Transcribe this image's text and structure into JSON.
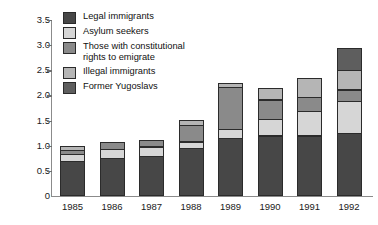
{
  "chart_data": {
    "type": "bar",
    "subtype": "stacked-vertical",
    "title": "",
    "subtitle": "",
    "xlabel": "",
    "ylabel": "Emigrants in millions",
    "categories": [
      "1985",
      "1986",
      "1987",
      "1988",
      "1989",
      "1990",
      "1991",
      "1992"
    ],
    "ylim": [
      0,
      3.5
    ],
    "ytick_labels": [
      "0",
      "0.5",
      "1.0",
      "1.5",
      "2.0",
      "2.5",
      "3.0",
      "3.5"
    ],
    "ytick_values": [
      0,
      0.5,
      1.0,
      1.5,
      2.0,
      2.5,
      3.0,
      3.5
    ],
    "grid": false,
    "legend_position": "inside-top-left",
    "units": "millions",
    "series": [
      {
        "name": "Legal immigrants",
        "color": "#474747",
        "values": [
          0.7,
          0.75,
          0.8,
          0.95,
          1.15,
          1.2,
          1.2,
          1.25
        ]
      },
      {
        "name": "Asylum seekers",
        "color": "#d6d6d6",
        "values": [
          0.15,
          0.2,
          0.2,
          0.15,
          0.2,
          0.35,
          0.5,
          0.65
        ]
      },
      {
        "name": "Those with constitutional\nrights to emigrate",
        "color": "#8a8a8a",
        "values": [
          0.1,
          0.15,
          0.15,
          0.35,
          0.85,
          0.4,
          0.3,
          0.25
        ]
      },
      {
        "name": "Illegal immigrants",
        "color": "#b5b5b5",
        "values": [
          0.1,
          0.0,
          0.0,
          0.1,
          0.1,
          0.25,
          0.4,
          0.4
        ]
      },
      {
        "name": "Former Yugoslavs",
        "color": "#5e5e5e",
        "values": [
          0.0,
          0.0,
          0.0,
          0.0,
          0.0,
          0.0,
          0.0,
          0.45
        ]
      }
    ],
    "totals": [
      1.05,
      1.1,
      1.15,
      1.55,
      2.3,
      2.2,
      2.4,
      3.0
    ]
  },
  "legend": {
    "items": [
      {
        "label": "Legal immigrants",
        "color": "#474747"
      },
      {
        "label": "Asylum seekers",
        "color": "#d6d6d6"
      },
      {
        "label": "Those with constitutional\nrights to emigrate",
        "color": "#8a8a8a"
      },
      {
        "label": "Illegal immigrants",
        "color": "#b5b5b5"
      },
      {
        "label": "Former Yugoslavs",
        "color": "#5e5e5e"
      }
    ]
  },
  "axes": {
    "y_title": "Emigrants in millions",
    "y_labels": [
      "3.5",
      "3.0",
      "2.5",
      "2.0",
      "1.5",
      "1.0",
      "0.5",
      "0"
    ],
    "x_labels": [
      "1985",
      "1986",
      "1987",
      "1988",
      "1989",
      "1990",
      "1991",
      "1992"
    ]
  },
  "colors": {
    "axis": "#8b8b8b",
    "outline": "#2b2b2b",
    "background": "#ffffff",
    "text": "#1a1a1a"
  }
}
